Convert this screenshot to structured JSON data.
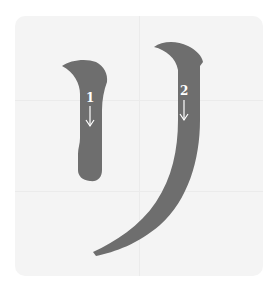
{
  "diagram": {
    "character": "リ",
    "reading": "ri",
    "type": "katakana stroke order",
    "strokes": [
      {
        "order": 1,
        "label": "1",
        "direction": "down",
        "arrow_icon": "down-arrow-icon"
      },
      {
        "order": 2,
        "label": "2",
        "direction": "down",
        "arrow_icon": "down-arrow-icon"
      }
    ],
    "colors": {
      "page": "#ffffff",
      "panel": "#f4f4f4",
      "grid": "#ebebeb",
      "stroke": "#6e6e6e",
      "label": "#ffffff"
    }
  }
}
